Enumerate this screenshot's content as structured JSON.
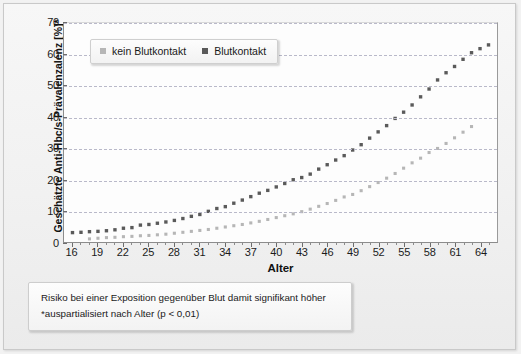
{
  "chart_data": {
    "type": "scatter",
    "title": "",
    "xlabel": "Alter",
    "ylabel": "Geschätzte Anti-Hbc/s-Prävalenzalenz [%]*",
    "xlim": [
      15,
      66
    ],
    "ylim": [
      0,
      70
    ],
    "grid": true,
    "legend_position": "top-left",
    "x_ticks": [
      16,
      19,
      22,
      25,
      28,
      31,
      34,
      37,
      40,
      43,
      46,
      49,
      52,
      55,
      58,
      61,
      64
    ],
    "y_ticks": [
      0,
      10,
      20,
      30,
      40,
      50,
      60,
      70
    ],
    "series": [
      {
        "name": "kein Blutkontakt",
        "color": "#b6b6b6",
        "x": [
          18,
          19,
          20,
          21,
          22,
          23,
          24,
          25,
          26,
          27,
          28,
          29,
          30,
          31,
          32,
          33,
          34,
          35,
          36,
          37,
          38,
          39,
          40,
          41,
          42,
          43,
          44,
          45,
          46,
          47,
          48,
          49,
          50,
          51,
          52,
          53,
          54,
          55,
          56,
          57,
          58,
          59,
          60,
          61,
          62,
          63
        ],
        "values": [
          1.0,
          1.2,
          1.4,
          1.5,
          1.7,
          1.8,
          2.0,
          2.1,
          2.3,
          2.5,
          2.8,
          3.1,
          3.4,
          3.7,
          4.0,
          4.4,
          4.8,
          5.2,
          5.6,
          6.1,
          6.6,
          7.2,
          7.8,
          8.4,
          9.0,
          9.7,
          10.5,
          11.4,
          12.3,
          13.3,
          14.4,
          15.2,
          16.4,
          17.7,
          19.0,
          20.4,
          21.9,
          23.6,
          25.3,
          26.8,
          28.6,
          29.9,
          31.5,
          33.3,
          35.1,
          36.9
        ]
      },
      {
        "name": "Blutkontakt",
        "color": "#5a5a5a",
        "x": [
          16,
          17,
          18,
          19,
          20,
          21,
          22,
          23,
          24,
          25,
          26,
          27,
          28,
          29,
          30,
          31,
          32,
          33,
          34,
          35,
          36,
          37,
          38,
          39,
          40,
          41,
          42,
          43,
          44,
          45,
          46,
          47,
          48,
          49,
          50,
          51,
          52,
          53,
          54,
          55,
          56,
          57,
          58,
          59,
          60,
          61,
          62,
          63,
          64,
          65
        ],
        "values": [
          3.0,
          3.1,
          3.3,
          3.4,
          3.6,
          3.9,
          4.4,
          4.6,
          5.4,
          5.6,
          6.0,
          6.4,
          6.9,
          7.5,
          8.2,
          8.8,
          9.8,
          10.7,
          11.3,
          12.4,
          13.4,
          14.5,
          15.6,
          16.5,
          17.6,
          18.7,
          19.9,
          20.6,
          21.7,
          23.3,
          24.7,
          26.2,
          27.6,
          29.4,
          31.1,
          33.2,
          35.2,
          37.2,
          39.5,
          41.5,
          43.8,
          46.4,
          48.9,
          51.8,
          54.1,
          56.1,
          58.4,
          60.5,
          61.8,
          63.0
        ]
      }
    ]
  },
  "legend": {
    "items": [
      {
        "label": "kein Blutkontakt",
        "color": "#b6b6b6"
      },
      {
        "label": "Blutkontakt",
        "color": "#5a5a5a"
      }
    ]
  },
  "axes": {
    "x_title": "Alter",
    "y_title": "Geschätzte Anti-Hbc/s-Prävalenzalenz [%]*"
  },
  "caption": {
    "line1": "Risiko bei einer Exposition gegenüber Blut damit signifikant höher",
    "line2": "*auspartialisiert nach Alter (p < 0,01)"
  }
}
